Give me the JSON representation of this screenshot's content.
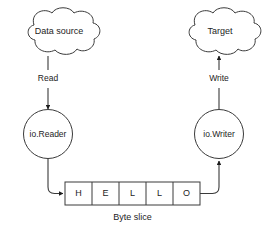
{
  "diagram": {
    "colors": {
      "stroke": "#3a3a3a",
      "text": "#1d1d1d",
      "background": "#ffffff",
      "arrowhead": "#1d1d1d"
    },
    "nodes": {
      "data_source": {
        "label": "Data source",
        "shape": "cloud"
      },
      "target": {
        "label": "Target",
        "shape": "cloud"
      },
      "io_reader": {
        "label": "io.Reader",
        "shape": "circle"
      },
      "io_writer": {
        "label": "io.Writer",
        "shape": "circle"
      }
    },
    "edges": {
      "read": {
        "label": "Read",
        "from": "data_source",
        "to": "io_reader",
        "direction": "down"
      },
      "write": {
        "label": "Write",
        "from": "io_writer",
        "to": "target",
        "direction": "up"
      },
      "reader_to_slice": {
        "label": "",
        "from": "io_reader",
        "to": "byte_slice",
        "direction": "right"
      },
      "slice_to_writer": {
        "label": "",
        "from": "byte_slice",
        "to": "io_writer",
        "direction": "up"
      }
    },
    "byte_slice": {
      "caption": "Byte slice",
      "cells": [
        "H",
        "E",
        "L",
        "L",
        "O"
      ]
    }
  }
}
